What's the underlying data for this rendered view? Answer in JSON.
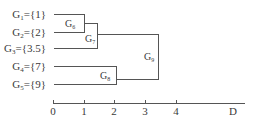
{
  "diagram": {
    "type": "dendrogram",
    "leaves": [
      {
        "name": "G",
        "sub": "1",
        "set": "={1}",
        "y": 14
      },
      {
        "name": "G",
        "sub": "2",
        "set": "={2}",
        "y": 32
      },
      {
        "name": "G",
        "sub": "3",
        "set": "={3.5}",
        "y": 48
      },
      {
        "name": "G",
        "sub": "4",
        "set": "={7}",
        "y": 66
      },
      {
        "name": "G",
        "sub": "5",
        "set": "={9}",
        "y": 84
      }
    ],
    "merges": [
      {
        "name": "G",
        "sub": "6",
        "children": [
          "G1",
          "G2"
        ],
        "distance": 1
      },
      {
        "name": "G",
        "sub": "7",
        "children": [
          "G6",
          "G3"
        ],
        "distance": 1.5
      },
      {
        "name": "G",
        "sub": "8",
        "children": [
          "G4",
          "G5"
        ],
        "distance": 2
      },
      {
        "name": "G",
        "sub": "9",
        "children": [
          "G7",
          "G8"
        ],
        "distance": 3.5
      }
    ],
    "axis": {
      "ticks": [
        "0",
        "1",
        "2",
        "3",
        "4"
      ],
      "label": "D"
    },
    "colors": {
      "line": "#555555",
      "text": "#3a3a3a",
      "background": "#ffffff"
    }
  }
}
